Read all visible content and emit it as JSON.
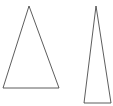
{
  "canvas": {
    "width": 113,
    "height": 106,
    "background": "#ffffff"
  },
  "stroke": {
    "color": "#333333",
    "width": 0.8
  },
  "shapes": [
    {
      "name": "isosceles-triangle-wide",
      "type": "triangle",
      "points": [
        [
          29,
          6
        ],
        [
          3,
          88
        ],
        [
          59,
          88
        ]
      ]
    },
    {
      "name": "isosceles-triangle-narrow",
      "type": "triangle",
      "points": [
        [
          96,
          6
        ],
        [
          84,
          103
        ],
        [
          111,
          103
        ]
      ]
    }
  ]
}
